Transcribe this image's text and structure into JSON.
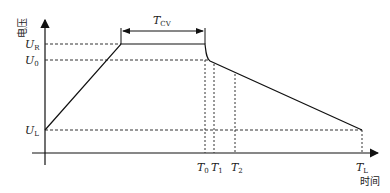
{
  "diagram": {
    "type": "charging-profile",
    "y_axis_label": "电压",
    "x_axis_label": "时间",
    "voltage_levels": [
      {
        "symbol": "U",
        "sub": "R"
      },
      {
        "symbol": "U",
        "sub": "0"
      },
      {
        "symbol": "U",
        "sub": "L"
      }
    ],
    "time_markers": [
      {
        "symbol": "T",
        "sub": "0"
      },
      {
        "symbol": "T",
        "sub": "1"
      },
      {
        "symbol": "T",
        "sub": "2"
      },
      {
        "symbol": "T",
        "sub": "L"
      }
    ],
    "interval_label": {
      "symbol": "T",
      "sub": "CV"
    },
    "profile_segments": [
      "linear rise from U_L to U_R",
      "constant voltage U_R for duration T_CV",
      "sharp drop to U_0 at T_0",
      "linear decline from U_0 to U_L at T_L"
    ]
  }
}
